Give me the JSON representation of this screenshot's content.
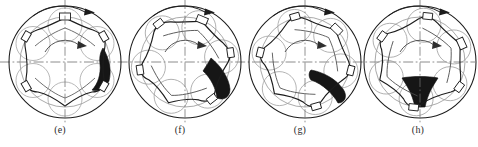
{
  "figure": {
    "panel_count": 4,
    "background_color": "#ffffff",
    "line_color": "#1c1c1c",
    "construction_color": "#8d8d8d",
    "fill_color": "#161616",
    "axis_color": "#6f6f6f"
  },
  "panels": [
    {
      "id": "panel-e",
      "caption": "(e)",
      "left": 0,
      "center_x": 65,
      "center_y": 62,
      "housing_radius": 56,
      "pitch_radius": 45,
      "rotor_lobes": 6,
      "rotation_label": "clockwise",
      "chamber_angle_deg": 15,
      "chamber_position": "right",
      "outer_arrow": "clockwise-top-arc",
      "inner_arrow": "clockwise-center-arc"
    },
    {
      "id": "panel-f",
      "caption": "(f)",
      "left": 120,
      "center_x": 65,
      "center_y": 62,
      "housing_radius": 56,
      "pitch_radius": 45,
      "rotor_lobes": 6,
      "rotation_label": "clockwise",
      "chamber_angle_deg": 38,
      "chamber_position": "lower-right",
      "outer_arrow": "clockwise-top-arc",
      "inner_arrow": "clockwise-center-arc"
    },
    {
      "id": "panel-g",
      "caption": "(g)",
      "left": 240,
      "center_x": 65,
      "center_y": 62,
      "housing_radius": 56,
      "pitch_radius": 45,
      "rotor_lobes": 6,
      "rotation_label": "clockwise",
      "chamber_angle_deg": 62,
      "chamber_position": "bottom-right",
      "outer_arrow": "clockwise-top-arc",
      "inner_arrow": "clockwise-center-arc"
    },
    {
      "id": "panel-h",
      "caption": "(h)",
      "left": 358,
      "center_x": 62,
      "center_y": 62,
      "housing_radius": 56,
      "pitch_radius": 45,
      "rotor_lobes": 6,
      "rotation_label": "clockwise",
      "chamber_angle_deg": 90,
      "chamber_position": "bottom",
      "outer_arrow": "clockwise-top-arc",
      "inner_arrow": "clockwise-center-arc"
    }
  ],
  "captions": {
    "e": "(e)",
    "f": "(f)",
    "g": "(g)",
    "h": "(h)"
  }
}
